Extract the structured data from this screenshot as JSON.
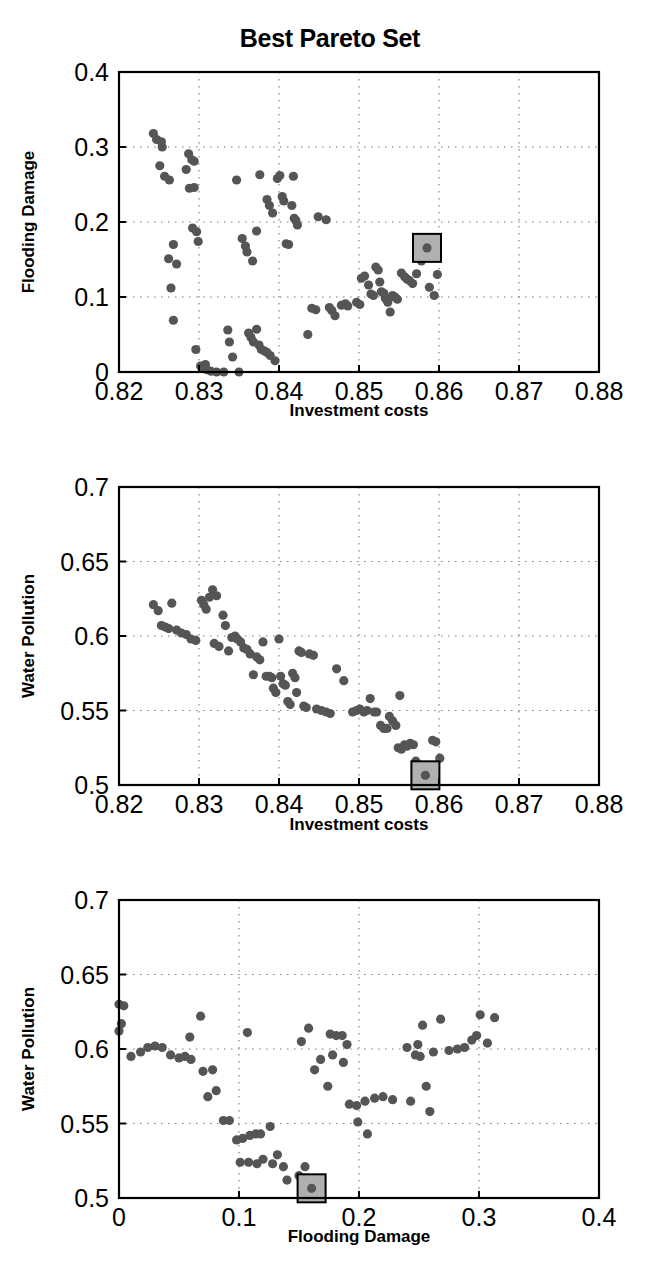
{
  "figure": {
    "title": "Best Pareto Set",
    "marker_color": "#555555",
    "highlight_fill": "#b0b0b0",
    "highlight_stroke": "#000000",
    "axis_color": "#000000",
    "grid_color": "#7a7a7a",
    "background": "#ffffff"
  },
  "chart_data": [
    {
      "type": "scatter",
      "title": "Best Pareto Set",
      "xlabel": "Investment costs",
      "ylabel": "Flooding Damage",
      "xlim": [
        0.82,
        0.88
      ],
      "ylim": [
        0.0,
        0.4
      ],
      "xticks": [
        "0.82",
        "0.83",
        "0.84",
        "0.85",
        "0.86",
        "0.87",
        "0.88"
      ],
      "xtick_values": [
        0.82,
        0.83,
        0.84,
        0.85,
        0.86,
        0.87,
        0.88
      ],
      "yticks": [
        "0",
        "0.1",
        "0.2",
        "0.3",
        "0.4"
      ],
      "ytick_values": [
        0.0,
        0.1,
        0.2,
        0.3,
        0.4
      ],
      "grid": true,
      "legend": null,
      "highlight": {
        "x": 0.8585,
        "y": 0.1655,
        "label": "selected-solution"
      },
      "points": [
        [
          0.8243,
          0.318
        ],
        [
          0.8247,
          0.31
        ],
        [
          0.8253,
          0.307
        ],
        [
          0.8254,
          0.3
        ],
        [
          0.8251,
          0.275
        ],
        [
          0.8257,
          0.261
        ],
        [
          0.8263,
          0.256
        ],
        [
          0.8268,
          0.17
        ],
        [
          0.8262,
          0.151
        ],
        [
          0.8272,
          0.144
        ],
        [
          0.8265,
          0.112
        ],
        [
          0.8268,
          0.069
        ],
        [
          0.8287,
          0.291
        ],
        [
          0.8291,
          0.283
        ],
        [
          0.8294,
          0.281
        ],
        [
          0.8284,
          0.27
        ],
        [
          0.8288,
          0.245
        ],
        [
          0.8294,
          0.246
        ],
        [
          0.8292,
          0.192
        ],
        [
          0.8297,
          0.187
        ],
        [
          0.8299,
          0.174
        ],
        [
          0.8296,
          0.03
        ],
        [
          0.8302,
          0.008
        ],
        [
          0.8306,
          0.006
        ],
        [
          0.8308,
          0.01
        ],
        [
          0.831,
          0.003
        ],
        [
          0.8315,
          0.001
        ],
        [
          0.8322,
          0.0
        ],
        [
          0.8331,
          0.0
        ],
        [
          0.8336,
          0.056
        ],
        [
          0.8338,
          0.04
        ],
        [
          0.8342,
          0.02
        ],
        [
          0.835,
          0.0
        ],
        [
          0.8347,
          0.256
        ],
        [
          0.8354,
          0.178
        ],
        [
          0.8358,
          0.168
        ],
        [
          0.836,
          0.16
        ],
        [
          0.8362,
          0.052
        ],
        [
          0.8365,
          0.046
        ],
        [
          0.8368,
          0.04
        ],
        [
          0.8367,
          0.148
        ],
        [
          0.8372,
          0.057
        ],
        [
          0.8375,
          0.036
        ],
        [
          0.8378,
          0.03
        ],
        [
          0.8382,
          0.028
        ],
        [
          0.8385,
          0.026
        ],
        [
          0.8389,
          0.022
        ],
        [
          0.8372,
          0.188
        ],
        [
          0.8376,
          0.263
        ],
        [
          0.8385,
          0.23
        ],
        [
          0.8388,
          0.222
        ],
        [
          0.8392,
          0.212
        ],
        [
          0.8395,
          0.015
        ],
        [
          0.8398,
          0.258
        ],
        [
          0.8401,
          0.262
        ],
        [
          0.8404,
          0.234
        ],
        [
          0.8406,
          0.228
        ],
        [
          0.8409,
          0.171
        ],
        [
          0.8412,
          0.17
        ],
        [
          0.8418,
          0.261
        ],
        [
          0.8416,
          0.222
        ],
        [
          0.8419,
          0.205
        ],
        [
          0.8421,
          0.202
        ],
        [
          0.8423,
          0.196
        ],
        [
          0.8436,
          0.05
        ],
        [
          0.8441,
          0.085
        ],
        [
          0.8446,
          0.083
        ],
        [
          0.8449,
          0.207
        ],
        [
          0.8459,
          0.203
        ],
        [
          0.8463,
          0.086
        ],
        [
          0.8466,
          0.082
        ],
        [
          0.847,
          0.075
        ],
        [
          0.8478,
          0.089
        ],
        [
          0.8483,
          0.091
        ],
        [
          0.8486,
          0.088
        ],
        [
          0.8497,
          0.093
        ],
        [
          0.8501,
          0.09
        ],
        [
          0.8503,
          0.125
        ],
        [
          0.8507,
          0.128
        ],
        [
          0.8512,
          0.116
        ],
        [
          0.8515,
          0.104
        ],
        [
          0.8518,
          0.102
        ],
        [
          0.8521,
          0.14
        ],
        [
          0.8524,
          0.136
        ],
        [
          0.8526,
          0.12
        ],
        [
          0.8528,
          0.107
        ],
        [
          0.8531,
          0.105
        ],
        [
          0.8533,
          0.098
        ],
        [
          0.8536,
          0.093
        ],
        [
          0.8539,
          0.08
        ],
        [
          0.8542,
          0.102
        ],
        [
          0.8545,
          0.1
        ],
        [
          0.8548,
          0.097
        ],
        [
          0.8553,
          0.132
        ],
        [
          0.8557,
          0.127
        ],
        [
          0.856,
          0.124
        ],
        [
          0.8563,
          0.122
        ],
        [
          0.8567,
          0.118
        ],
        [
          0.8572,
          0.131
        ],
        [
          0.8578,
          0.148
        ],
        [
          0.8583,
          0.165
        ],
        [
          0.8588,
          0.113
        ],
        [
          0.8594,
          0.102
        ],
        [
          0.8598,
          0.13
        ]
      ]
    },
    {
      "type": "scatter",
      "title": "",
      "xlabel": "Investment costs",
      "ylabel": "Water Pollution",
      "xlim": [
        0.82,
        0.88
      ],
      "ylim": [
        0.5,
        0.7
      ],
      "xticks": [
        "0.82",
        "0.83",
        "0.84",
        "0.85",
        "0.86",
        "0.87",
        "0.88"
      ],
      "xtick_values": [
        0.82,
        0.83,
        0.84,
        0.85,
        0.86,
        0.87,
        0.88
      ],
      "yticks": [
        "0.5",
        "0.55",
        "0.6",
        "0.65",
        "0.7"
      ],
      "ytick_values": [
        0.5,
        0.55,
        0.6,
        0.65,
        0.7
      ],
      "grid": true,
      "legend": null,
      "highlight": {
        "x": 0.8583,
        "y": 0.5065,
        "label": "selected-solution"
      },
      "points": [
        [
          0.8243,
          0.621
        ],
        [
          0.8249,
          0.617
        ],
        [
          0.8253,
          0.607
        ],
        [
          0.8258,
          0.606
        ],
        [
          0.8262,
          0.605
        ],
        [
          0.8266,
          0.622
        ],
        [
          0.8272,
          0.604
        ],
        [
          0.8278,
          0.602
        ],
        [
          0.8284,
          0.601
        ],
        [
          0.829,
          0.598
        ],
        [
          0.8296,
          0.597
        ],
        [
          0.8303,
          0.624
        ],
        [
          0.8306,
          0.621
        ],
        [
          0.8309,
          0.618
        ],
        [
          0.8313,
          0.626
        ],
        [
          0.8317,
          0.631
        ],
        [
          0.8322,
          0.627
        ],
        [
          0.8319,
          0.595
        ],
        [
          0.8325,
          0.593
        ],
        [
          0.833,
          0.614
        ],
        [
          0.8333,
          0.607
        ],
        [
          0.8337,
          0.59
        ],
        [
          0.8341,
          0.599
        ],
        [
          0.8345,
          0.6
        ],
        [
          0.8348,
          0.598
        ],
        [
          0.8352,
          0.596
        ],
        [
          0.8356,
          0.592
        ],
        [
          0.836,
          0.591
        ],
        [
          0.8364,
          0.588
        ],
        [
          0.8368,
          0.574
        ],
        [
          0.8372,
          0.586
        ],
        [
          0.8376,
          0.584
        ],
        [
          0.838,
          0.596
        ],
        [
          0.8384,
          0.573
        ],
        [
          0.8388,
          0.573
        ],
        [
          0.8391,
          0.572
        ],
        [
          0.8393,
          0.565
        ],
        [
          0.8396,
          0.562
        ],
        [
          0.84,
          0.598
        ],
        [
          0.8402,
          0.573
        ],
        [
          0.8405,
          0.568
        ],
        [
          0.8408,
          0.567
        ],
        [
          0.8411,
          0.556
        ],
        [
          0.8414,
          0.554
        ],
        [
          0.8417,
          0.575
        ],
        [
          0.842,
          0.572
        ],
        [
          0.8422,
          0.562
        ],
        [
          0.8425,
          0.59
        ],
        [
          0.8428,
          0.589
        ],
        [
          0.8431,
          0.553
        ],
        [
          0.8434,
          0.552
        ],
        [
          0.8438,
          0.588
        ],
        [
          0.8443,
          0.587
        ],
        [
          0.8447,
          0.551
        ],
        [
          0.8453,
          0.55
        ],
        [
          0.8459,
          0.549
        ],
        [
          0.8464,
          0.548
        ],
        [
          0.8472,
          0.578
        ],
        [
          0.8481,
          0.57
        ],
        [
          0.8492,
          0.549
        ],
        [
          0.8497,
          0.55
        ],
        [
          0.8501,
          0.551
        ],
        [
          0.8506,
          0.549
        ],
        [
          0.851,
          0.55
        ],
        [
          0.8514,
          0.558
        ],
        [
          0.8519,
          0.549
        ],
        [
          0.8522,
          0.549
        ],
        [
          0.8527,
          0.54
        ],
        [
          0.8531,
          0.538
        ],
        [
          0.8535,
          0.538
        ],
        [
          0.8538,
          0.546
        ],
        [
          0.8542,
          0.543
        ],
        [
          0.8546,
          0.54
        ],
        [
          0.8551,
          0.56
        ],
        [
          0.8549,
          0.525
        ],
        [
          0.8553,
          0.524
        ],
        [
          0.8557,
          0.527
        ],
        [
          0.856,
          0.526
        ],
        [
          0.8564,
          0.528
        ],
        [
          0.8568,
          0.527
        ],
        [
          0.8571,
          0.516
        ],
        [
          0.8574,
          0.514
        ],
        [
          0.8578,
          0.513
        ],
        [
          0.8581,
          0.513
        ],
        [
          0.8583,
          0.506
        ],
        [
          0.8588,
          0.511
        ],
        [
          0.8592,
          0.53
        ],
        [
          0.8596,
          0.529
        ],
        [
          0.8601,
          0.518
        ]
      ]
    },
    {
      "type": "scatter",
      "title": "",
      "xlabel": "Flooding Damage",
      "ylabel": "Water Pollution",
      "xlim": [
        0.0,
        0.4
      ],
      "ylim": [
        0.5,
        0.7
      ],
      "xticks": [
        "0",
        "0.1",
        "0.2",
        "0.3",
        "0.4"
      ],
      "xtick_values": [
        0.0,
        0.1,
        0.2,
        0.3,
        0.4
      ],
      "yticks": [
        "0.5",
        "0.55",
        "0.6",
        "0.65",
        "0.7"
      ],
      "ytick_values": [
        0.5,
        0.55,
        0.6,
        0.65,
        0.7
      ],
      "grid": true,
      "legend": null,
      "highlight": {
        "x": 0.1605,
        "y": 0.5065,
        "label": "selected-solution"
      },
      "points": [
        [
          0.0,
          0.63
        ],
        [
          0.004,
          0.629
        ],
        [
          0.002,
          0.617
        ],
        [
          0.0,
          0.612
        ],
        [
          0.01,
          0.595
        ],
        [
          0.018,
          0.598
        ],
        [
          0.024,
          0.601
        ],
        [
          0.03,
          0.602
        ],
        [
          0.036,
          0.601
        ],
        [
          0.043,
          0.596
        ],
        [
          0.05,
          0.594
        ],
        [
          0.055,
          0.595
        ],
        [
          0.06,
          0.593
        ],
        [
          0.059,
          0.608
        ],
        [
          0.068,
          0.622
        ],
        [
          0.07,
          0.585
        ],
        [
          0.078,
          0.586
        ],
        [
          0.074,
          0.568
        ],
        [
          0.081,
          0.572
        ],
        [
          0.087,
          0.552
        ],
        [
          0.092,
          0.552
        ],
        [
          0.098,
          0.539
        ],
        [
          0.103,
          0.54
        ],
        [
          0.107,
          0.611
        ],
        [
          0.109,
          0.542
        ],
        [
          0.114,
          0.543
        ],
        [
          0.118,
          0.543
        ],
        [
          0.101,
          0.524
        ],
        [
          0.108,
          0.524
        ],
        [
          0.115,
          0.523
        ],
        [
          0.12,
          0.526
        ],
        [
          0.126,
          0.548
        ],
        [
          0.128,
          0.523
        ],
        [
          0.132,
          0.529
        ],
        [
          0.137,
          0.521
        ],
        [
          0.14,
          0.512
        ],
        [
          0.15,
          0.515
        ],
        [
          0.155,
          0.521
        ],
        [
          0.16,
          0.507
        ],
        [
          0.152,
          0.605
        ],
        [
          0.158,
          0.614
        ],
        [
          0.163,
          0.586
        ],
        [
          0.168,
          0.593
        ],
        [
          0.174,
          0.575
        ],
        [
          0.178,
          0.596
        ],
        [
          0.181,
          0.609
        ],
        [
          0.176,
          0.61
        ],
        [
          0.186,
          0.609
        ],
        [
          0.187,
          0.591
        ],
        [
          0.19,
          0.603
        ],
        [
          0.192,
          0.563
        ],
        [
          0.198,
          0.562
        ],
        [
          0.199,
          0.551
        ],
        [
          0.205,
          0.565
        ],
        [
          0.207,
          0.543
        ],
        [
          0.213,
          0.567
        ],
        [
          0.22,
          0.568
        ],
        [
          0.228,
          0.566
        ],
        [
          0.24,
          0.601
        ],
        [
          0.243,
          0.565
        ],
        [
          0.247,
          0.596
        ],
        [
          0.249,
          0.603
        ],
        [
          0.251,
          0.595
        ],
        [
          0.253,
          0.616
        ],
        [
          0.256,
          0.575
        ],
        [
          0.259,
          0.558
        ],
        [
          0.262,
          0.598
        ],
        [
          0.268,
          0.62
        ],
        [
          0.275,
          0.599
        ],
        [
          0.282,
          0.6
        ],
        [
          0.288,
          0.601
        ],
        [
          0.294,
          0.606
        ],
        [
          0.298,
          0.609
        ],
        [
          0.301,
          0.623
        ],
        [
          0.307,
          0.604
        ],
        [
          0.313,
          0.621
        ]
      ]
    }
  ],
  "panels": [
    {
      "name": "panel-flooding-vs-investment",
      "xlabel": "Investment costs",
      "ylabel": "Flooding Damage",
      "xticks": [
        "0.82",
        "0.83",
        "0.84",
        "0.85",
        "0.86",
        "0.87",
        "0.88"
      ],
      "yticks": [
        "0",
        "0.1",
        "0.2",
        "0.3",
        "0.4"
      ]
    },
    {
      "name": "panel-pollution-vs-investment",
      "xlabel": "Investment costs",
      "ylabel": "Water Pollution",
      "xticks": [
        "0.82",
        "0.83",
        "0.84",
        "0.85",
        "0.86",
        "0.87",
        "0.88"
      ],
      "yticks": [
        "0.5",
        "0.55",
        "0.6",
        "0.65",
        "0.7"
      ]
    },
    {
      "name": "panel-pollution-vs-flooding",
      "xlabel": "Flooding Damage",
      "ylabel": "Water Pollution",
      "xticks": [
        "0",
        "0.1",
        "0.2",
        "0.3",
        "0.4"
      ],
      "yticks": [
        "0.5",
        "0.55",
        "0.6",
        "0.65",
        "0.7"
      ]
    }
  ]
}
